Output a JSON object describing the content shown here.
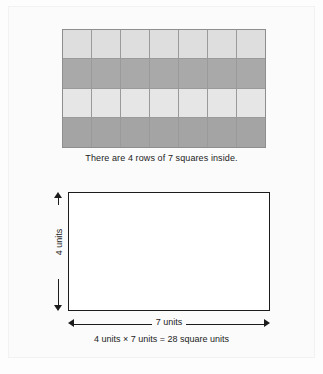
{
  "figure": {
    "grid": {
      "rows": 4,
      "columns": 7,
      "row_shades": [
        "light",
        "dark",
        "light2",
        "dark2"
      ],
      "colors": {
        "light": "#dedede",
        "dark": "#a9a9a9",
        "light2": "#e6e6e6",
        "dark2": "#a4a4a4",
        "cell_border": "#9a9a9a",
        "outline": "#8e8e8e"
      },
      "caption": "There are 4 rows of 7 squares inside."
    },
    "rectangle": {
      "height_label": "4 units",
      "width_label": "7 units",
      "equation": "4 units × 7 units = 28 square units",
      "outline_color": "#1c1c1c",
      "fill_color": "#ffffff"
    },
    "footer_partial": ""
  },
  "chart_data": {
    "type": "table",
    "rows": 4,
    "columns": 7,
    "total_squares": 28,
    "height_units": 4,
    "width_units": 7,
    "area_square_units": 28,
    "annotations": [
      "There are 4 rows of 7 squares inside.",
      "4 units",
      "7 units",
      "4 units × 7 units = 28 square units"
    ]
  }
}
